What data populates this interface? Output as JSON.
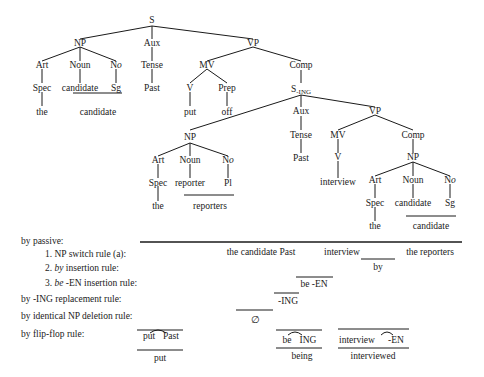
{
  "tree": {
    "root": "S",
    "np1": {
      "label": "NP",
      "art": "Art",
      "spec": "Spec",
      "the": "the",
      "noun": "Noun",
      "noun_val": "candidate",
      "no": "N",
      "no_sub": "o",
      "no_val": "Sg",
      "merged": "candidate"
    },
    "aux1": {
      "label": "Aux",
      "tense": "Tense",
      "val": "Past"
    },
    "vp1": {
      "label": "VP",
      "mv": "MV",
      "v": "V",
      "v_val": "put",
      "prep": "Prep",
      "prep_val": "off",
      "comp": "Comp"
    },
    "sing": {
      "label": "S",
      "sub": "-ING"
    },
    "np2": {
      "label": "NP",
      "art": "Art",
      "spec": "Spec",
      "the": "the",
      "noun": "Noun",
      "noun_val": "reporter",
      "no": "N",
      "no_sub": "o",
      "no_val": "Pl",
      "merged": "reporters"
    },
    "aux2": {
      "label": "Aux",
      "tense": "Tense",
      "val": "Past"
    },
    "vp2": {
      "label": "VP",
      "mv": "MV",
      "v": "V",
      "v_val": "interview",
      "comp": "Comp"
    },
    "np3": {
      "label": "NP",
      "art": "Art",
      "spec": "Spec",
      "the": "the",
      "noun": "Noun",
      "noun_val": "candidate",
      "no": "N",
      "no_sub": "o",
      "no_val": "Sg",
      "merged": "candidate"
    }
  },
  "rules": {
    "passive": "by passive:",
    "r1": "1. NP switch rule (a):",
    "r2_num": "2. ",
    "r2_it": "by",
    "r2_rest": " insertion rule:",
    "r3_num": "3. ",
    "r3_it": "be",
    "r3_rest": " -EN insertion rule:",
    "ing": "by -ING replacement rule:",
    "identical": "by identical NP deletion rule:",
    "flipflop": "by flip-flop rule:"
  },
  "derivation": {
    "np_switch": {
      "left": "the candidate Past",
      "mid": "interview",
      "right": "the reporters"
    },
    "by_insert": "by",
    "be_en": "be -EN",
    "ing": "-ING",
    "deletion": "∅",
    "flip1": {
      "top_a": "put",
      "top_b": "Past",
      "bottom": "put"
    },
    "flip2": {
      "top_a": "be",
      "top_b": "ING",
      "bottom": "being"
    },
    "flip3": {
      "top_a": "interview",
      "top_b": "-EN",
      "bottom": "interviewed"
    }
  }
}
